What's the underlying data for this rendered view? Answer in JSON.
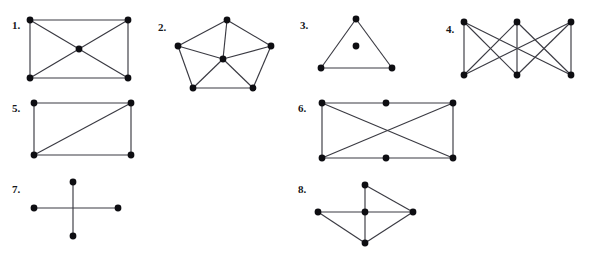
{
  "page": {
    "background_color": "#ffffff",
    "ink_color": "#0e0e12",
    "edge_color": "#3a3a42",
    "cutoff_header_text": "· ·  · · ·   · ·  · ·",
    "width": 589,
    "height": 267
  },
  "figures": [
    {
      "label": "1.",
      "name": "graph-1",
      "description": "rectangle with center vertex joined to all four corners",
      "label_pos": {
        "x": 12,
        "y": 20
      },
      "box": {
        "x": 24,
        "y": 14,
        "w": 110,
        "h": 70
      },
      "vertex_radius": 3.4,
      "vertices": [
        {
          "id": "tl",
          "x": 6,
          "y": 6
        },
        {
          "id": "tr",
          "x": 104,
          "y": 6
        },
        {
          "id": "bl",
          "x": 6,
          "y": 64
        },
        {
          "id": "br",
          "x": 104,
          "y": 64
        },
        {
          "id": "c",
          "x": 55,
          "y": 35
        }
      ],
      "edges": [
        [
          "tl",
          "tr"
        ],
        [
          "tr",
          "br"
        ],
        [
          "br",
          "bl"
        ],
        [
          "bl",
          "tl"
        ],
        [
          "tl",
          "c"
        ],
        [
          "tr",
          "c"
        ],
        [
          "bl",
          "c"
        ],
        [
          "br",
          "c"
        ]
      ]
    },
    {
      "label": "2.",
      "name": "graph-2",
      "description": "pentagon wheel: 5-cycle with hub vertex joined to all five",
      "label_pos": {
        "x": 158,
        "y": 22
      },
      "box": {
        "x": 172,
        "y": 14,
        "w": 108,
        "h": 80
      },
      "vertex_radius": 3.4,
      "vertices": [
        {
          "id": "t",
          "x": 55,
          "y": 6
        },
        {
          "id": "ul",
          "x": 6,
          "y": 32
        },
        {
          "id": "ur",
          "x": 99,
          "y": 32
        },
        {
          "id": "ll",
          "x": 21,
          "y": 74
        },
        {
          "id": "lr",
          "x": 81,
          "y": 74
        },
        {
          "id": "c",
          "x": 51,
          "y": 45
        }
      ],
      "edges": [
        [
          "t",
          "ul"
        ],
        [
          "t",
          "ur"
        ],
        [
          "ul",
          "ll"
        ],
        [
          "ur",
          "lr"
        ],
        [
          "ll",
          "lr"
        ],
        [
          "c",
          "t"
        ],
        [
          "c",
          "ul"
        ],
        [
          "c",
          "ur"
        ],
        [
          "c",
          "ll"
        ],
        [
          "c",
          "lr"
        ]
      ]
    },
    {
      "label": "3.",
      "name": "graph-3",
      "description": "triangle with one isolated vertex inside",
      "label_pos": {
        "x": 300,
        "y": 20
      },
      "box": {
        "x": 316,
        "y": 14,
        "w": 82,
        "h": 60
      },
      "vertex_radius": 3.4,
      "vertices": [
        {
          "id": "t",
          "x": 40,
          "y": 5
        },
        {
          "id": "bl",
          "x": 5,
          "y": 54
        },
        {
          "id": "br",
          "x": 76,
          "y": 54
        },
        {
          "id": "c",
          "x": 40,
          "y": 32
        }
      ],
      "edges": [
        [
          "t",
          "bl"
        ],
        [
          "t",
          "br"
        ],
        [
          "bl",
          "br"
        ]
      ]
    },
    {
      "label": "4.",
      "name": "graph-4",
      "description": "complete bipartite graph K3,3 on two rows of three vertices",
      "label_pos": {
        "x": 446,
        "y": 24
      },
      "box": {
        "x": 459,
        "y": 16,
        "w": 120,
        "h": 66
      },
      "vertex_radius": 3.4,
      "vertices": [
        {
          "id": "t1",
          "x": 5,
          "y": 6
        },
        {
          "id": "t2",
          "x": 58,
          "y": 6
        },
        {
          "id": "t3",
          "x": 112,
          "y": 6
        },
        {
          "id": "b1",
          "x": 5,
          "y": 59
        },
        {
          "id": "b2",
          "x": 58,
          "y": 59
        },
        {
          "id": "b3",
          "x": 112,
          "y": 59
        }
      ],
      "edges": [
        [
          "t1",
          "b1"
        ],
        [
          "t1",
          "b2"
        ],
        [
          "t1",
          "b3"
        ],
        [
          "t2",
          "b1"
        ],
        [
          "t2",
          "b2"
        ],
        [
          "t2",
          "b3"
        ],
        [
          "t3",
          "b1"
        ],
        [
          "t3",
          "b2"
        ],
        [
          "t3",
          "b3"
        ]
      ]
    },
    {
      "label": "5.",
      "name": "graph-5",
      "description": "rectangle with a single diagonal from lower-left to upper-right",
      "label_pos": {
        "x": 12,
        "y": 103
      },
      "box": {
        "x": 28,
        "y": 98,
        "w": 110,
        "h": 62
      },
      "vertex_radius": 3.4,
      "vertices": [
        {
          "id": "tl",
          "x": 6,
          "y": 5
        },
        {
          "id": "tr",
          "x": 103,
          "y": 5
        },
        {
          "id": "bl",
          "x": 6,
          "y": 57
        },
        {
          "id": "br",
          "x": 103,
          "y": 57
        }
      ],
      "edges": [
        [
          "tl",
          "tr"
        ],
        [
          "tr",
          "br"
        ],
        [
          "br",
          "bl"
        ],
        [
          "bl",
          "tl"
        ],
        [
          "bl",
          "tr"
        ]
      ]
    },
    {
      "label": "6.",
      "name": "graph-6",
      "description": "rectangle with midpoints on top and bottom edges plus both diagonals",
      "label_pos": {
        "x": 298,
        "y": 103
      },
      "box": {
        "x": 316,
        "y": 98,
        "w": 144,
        "h": 65
      },
      "vertex_radius": 3.4,
      "vertices": [
        {
          "id": "tl",
          "x": 6,
          "y": 5
        },
        {
          "id": "tm",
          "x": 70,
          "y": 5
        },
        {
          "id": "tr",
          "x": 137,
          "y": 5
        },
        {
          "id": "bl",
          "x": 6,
          "y": 60
        },
        {
          "id": "bm",
          "x": 70,
          "y": 60
        },
        {
          "id": "br",
          "x": 137,
          "y": 60
        }
      ],
      "edges": [
        [
          "tl",
          "tm"
        ],
        [
          "tm",
          "tr"
        ],
        [
          "bl",
          "bm"
        ],
        [
          "bm",
          "br"
        ],
        [
          "tl",
          "bl"
        ],
        [
          "tr",
          "br"
        ],
        [
          "tl",
          "br"
        ],
        [
          "tr",
          "bl"
        ]
      ]
    },
    {
      "label": "7.",
      "name": "graph-7",
      "description": "two crossing segments forming a plus sign, four endpoint vertices, no vertex at the crossing",
      "label_pos": {
        "x": 12,
        "y": 184
      },
      "box": {
        "x": 30,
        "y": 178,
        "w": 92,
        "h": 62
      },
      "vertex_radius": 3.4,
      "vertices": [
        {
          "id": "top",
          "x": 43,
          "y": 4
        },
        {
          "id": "bottom",
          "x": 43,
          "y": 58
        },
        {
          "id": "left",
          "x": 4,
          "y": 30
        },
        {
          "id": "right",
          "x": 88,
          "y": 30
        }
      ],
      "edges": [
        [
          "top",
          "bottom"
        ],
        [
          "left",
          "right"
        ]
      ]
    },
    {
      "label": "8.",
      "name": "graph-8",
      "description": "five vertices: hub joined to top, left, right and bottom with outer triangle edges",
      "label_pos": {
        "x": 298,
        "y": 184
      },
      "box": {
        "x": 314,
        "y": 180,
        "w": 104,
        "h": 68
      },
      "vertex_radius": 3.4,
      "vertices": [
        {
          "id": "top",
          "x": 51,
          "y": 5
        },
        {
          "id": "left",
          "x": 4,
          "y": 32
        },
        {
          "id": "center",
          "x": 51,
          "y": 32
        },
        {
          "id": "right",
          "x": 99,
          "y": 32
        },
        {
          "id": "bottom",
          "x": 51,
          "y": 63
        }
      ],
      "edges": [
        [
          "top",
          "center"
        ],
        [
          "top",
          "right"
        ],
        [
          "left",
          "center"
        ],
        [
          "center",
          "right"
        ],
        [
          "center",
          "bottom"
        ],
        [
          "left",
          "bottom"
        ],
        [
          "bottom",
          "right"
        ]
      ]
    }
  ]
}
